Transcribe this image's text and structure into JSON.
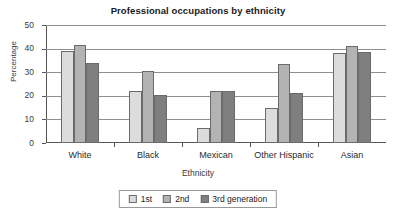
{
  "chart_data": {
    "type": "bar",
    "title": "Professional occupations by ethnicity",
    "xlabel": "Ethnicity",
    "ylabel": "Percentage",
    "categories": [
      "White",
      "Black",
      "Mexican",
      "Other Hispanic",
      "Asian"
    ],
    "series": [
      {
        "name": "1st",
        "values": [
          39,
          22,
          6.5,
          15,
          38
        ]
      },
      {
        "name": "2nd",
        "values": [
          41.5,
          30.5,
          22,
          33.5,
          41
        ]
      },
      {
        "name": "3rd generation",
        "values": [
          34,
          20.5,
          22,
          21,
          38.5
        ]
      }
    ],
    "ylim": [
      0,
      50
    ],
    "yticks": [
      0,
      10,
      20,
      30,
      40,
      50
    ],
    "ytick_labels": [
      "0",
      "10",
      "20",
      "30",
      "40",
      "50"
    ],
    "grid": true,
    "legend_position": "bottom",
    "series_colors": [
      "#dcdcdc",
      "#b3b3b3",
      "#7f7f7f"
    ]
  }
}
